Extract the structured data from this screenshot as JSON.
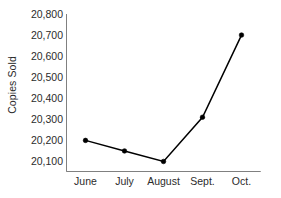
{
  "chart_data": {
    "type": "line",
    "title": "",
    "xlabel": "",
    "ylabel": "Copies Sold",
    "categories": [
      "June",
      "July",
      "August",
      "Sept.",
      "Oct."
    ],
    "values": [
      20200,
      20150,
      20100,
      20310,
      20700
    ],
    "series": [
      {
        "name": "Copies Sold",
        "values": [
          20200,
          20150,
          20100,
          20310,
          20700
        ]
      }
    ],
    "ylim": [
      20050,
      20800
    ],
    "y_ticks": [
      20100,
      20200,
      20300,
      20400,
      20500,
      20600,
      20700,
      20800
    ],
    "y_tick_labels": [
      "20,100",
      "20,200",
      "20,300",
      "20,400",
      "20,500",
      "20,600",
      "20,700",
      "20,800"
    ],
    "grid": false,
    "legend": "none",
    "marker": "filled-dot",
    "line_color": "#000000",
    "marker_color": "#000000",
    "axis_color": "#808080",
    "text_color": "#2b2b2b",
    "background_color": "#ffffff"
  }
}
